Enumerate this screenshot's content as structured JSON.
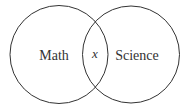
{
  "diagram": {
    "type": "venn",
    "sets": [
      {
        "label": "Math"
      },
      {
        "label": "Science"
      }
    ],
    "intersection_label": "x",
    "stroke_color": "#333333"
  }
}
